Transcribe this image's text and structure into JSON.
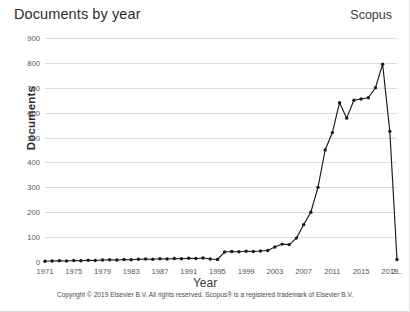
{
  "chart_title": "Documents by year",
  "brand": "Scopus",
  "xlabel": "Year",
  "ylabel": "Documents",
  "copyright": "Copyright © 2019 Elsevier B.V. All rights reserved. Scopus® is a registered trademark of Elsevier B.V.",
  "axis": {
    "y_ticks": [
      "0",
      "100",
      "200",
      "300",
      "400",
      "500",
      "600",
      "700",
      "800",
      "900"
    ],
    "x_ticks": [
      "1971",
      "1975",
      "1979",
      "1983",
      "1987",
      "1991",
      "1995",
      "1999",
      "2003",
      "2007",
      "2011",
      "2015",
      "2019",
      "2..."
    ]
  },
  "chart_data": {
    "type": "line",
    "title": "Documents by year",
    "xlabel": "Year",
    "ylabel": "Documents",
    "xlim": [
      1971,
      2020
    ],
    "ylim": [
      0,
      900
    ],
    "grid": true,
    "legend": false,
    "markers": true,
    "line_color": "#1a1a1a",
    "x": [
      1971,
      1972,
      1973,
      1974,
      1975,
      1976,
      1977,
      1978,
      1979,
      1980,
      1981,
      1982,
      1983,
      1984,
      1985,
      1986,
      1987,
      1988,
      1989,
      1990,
      1991,
      1992,
      1993,
      1994,
      1995,
      1996,
      1997,
      1998,
      1999,
      2000,
      2001,
      2002,
      2003,
      2004,
      2005,
      2006,
      2007,
      2008,
      2009,
      2010,
      2011,
      2012,
      2013,
      2014,
      2015,
      2016,
      2017,
      2018,
      2019,
      2020
    ],
    "values": [
      3,
      4,
      5,
      4,
      6,
      5,
      7,
      6,
      8,
      9,
      8,
      10,
      9,
      11,
      12,
      11,
      13,
      12,
      14,
      13,
      15,
      14,
      16,
      12,
      10,
      40,
      42,
      41,
      43,
      42,
      44,
      46,
      60,
      72,
      70,
      96,
      150,
      200,
      300,
      450,
      520,
      640,
      578,
      650,
      655,
      660,
      700,
      795,
      525,
      10
    ],
    "annotations": [
      "Final x tick label is truncated as '2...'"
    ]
  }
}
